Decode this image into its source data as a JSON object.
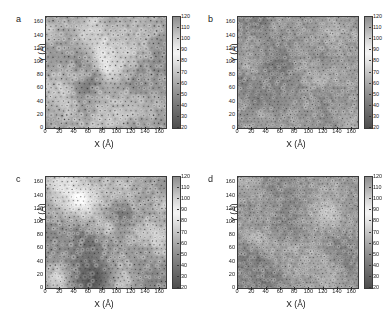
{
  "figure": {
    "caption": "",
    "background": "#ffffff",
    "panel_count": 4
  },
  "axis": {
    "xlabel": "X (Å)",
    "ylabel": "Y (Å)",
    "xticks": [
      0,
      20,
      40,
      60,
      80,
      100,
      120,
      140,
      160
    ],
    "yticks": [
      0,
      20,
      40,
      60,
      80,
      100,
      120,
      140,
      160
    ],
    "xlim": [
      0,
      168
    ],
    "ylim": [
      0,
      168
    ]
  },
  "colorbar": {
    "ticks": [
      120,
      110,
      100,
      90,
      80,
      70,
      60,
      50,
      40,
      30,
      20
    ],
    "min": 20,
    "max": 120,
    "colormap": "grayscale",
    "low_color": "#4d4d4d",
    "high_color": "#8e8e8e",
    "mid_color": "#f4f4f4"
  },
  "panels": [
    {
      "letter": "a",
      "xlabel": "X (Å)",
      "ylabel": "Y (Å)",
      "seed": 11,
      "grain": 0.62,
      "ring_density": 0.72,
      "contrast": 1.25,
      "blob_scale": 26
    },
    {
      "letter": "b",
      "xlabel": "X (Å)",
      "ylabel": "Y (Å)",
      "seed": 47,
      "grain": 0.45,
      "ring_density": 0.95,
      "contrast": 0.78,
      "blob_scale": 17
    },
    {
      "letter": "c",
      "xlabel": "X (Å)",
      "ylabel": "Y (Å)",
      "seed": 83,
      "grain": 0.6,
      "ring_density": 0.8,
      "contrast": 1.18,
      "blob_scale": 24
    },
    {
      "letter": "d",
      "xlabel": "X (Å)",
      "ylabel": "Y (Å)",
      "seed": 131,
      "grain": 0.44,
      "ring_density": 1.0,
      "contrast": 0.8,
      "blob_scale": 16
    }
  ],
  "chart_data": {
    "type": "heatmap",
    "title": "",
    "subtitle": "",
    "panel_labels": [
      "a",
      "b",
      "c",
      "d"
    ],
    "xlabel": "X (Å)",
    "ylabel": "Y (Å)",
    "xticklabels": [
      "0",
      "20",
      "40",
      "60",
      "80",
      "100",
      "120",
      "140",
      "160"
    ],
    "yticklabels": [
      "0",
      "20",
      "40",
      "60",
      "80",
      "100",
      "120",
      "140",
      "160"
    ],
    "x": [
      0,
      20,
      40,
      60,
      80,
      100,
      120,
      140,
      160
    ],
    "y": [
      0,
      20,
      40,
      60,
      80,
      100,
      120,
      140,
      160
    ],
    "xlim": [
      0,
      168
    ],
    "ylim": [
      0,
      168
    ],
    "grid": false,
    "legend": "none",
    "colorbar": {
      "label": "",
      "ticklabels": [
        "120",
        "110",
        "100",
        "90",
        "80",
        "70",
        "60",
        "50",
        "40",
        "30",
        "20"
      ],
      "range": [
        20,
        120
      ],
      "orientation": "vertical",
      "position": "right-of-axes",
      "colormap": "gray"
    },
    "series": [
      {
        "name": "a",
        "description": "Atomic-resolution grayscale map, 168x168 Angstrom, large dark mesoscale domains with bright ring features",
        "zrange": [
          20,
          120
        ],
        "zmean": 72,
        "bright_fraction": 0.34,
        "dark_fraction": 0.31
      },
      {
        "name": "b",
        "description": "Atomic-resolution grayscale map, 168x168 Angstrom, uniform fine-grained ring lattice, low mesoscale contrast",
        "zrange": [
          20,
          120
        ],
        "zmean": 76,
        "bright_fraction": 0.22,
        "dark_fraction": 0.18
      },
      {
        "name": "c",
        "description": "Atomic-resolution grayscale map, 168x168 Angstrom, strong patchy dark domains bottom-left and right edge",
        "zrange": [
          20,
          120
        ],
        "zmean": 70,
        "bright_fraction": 0.36,
        "dark_fraction": 0.33
      },
      {
        "name": "d",
        "description": "Atomic-resolution grayscale map, 168x168 Angstrom, dense uniform ring lattice with faint dark clusters",
        "zrange": [
          20,
          120
        ],
        "zmean": 77,
        "bright_fraction": 0.2,
        "dark_fraction": 0.17
      }
    ]
  }
}
